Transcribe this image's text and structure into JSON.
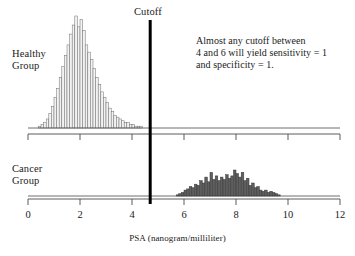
{
  "figure": {
    "title": "",
    "cutoff_label": "Cutoff",
    "annotation_lines": [
      "Almost any cutoff between",
      "4 and 6 will yield sensitivity = 1",
      "and specificity = 1."
    ],
    "healthy_group_label_lines": [
      "Healthy",
      "Group"
    ],
    "cancer_group_label_lines": [
      "Cancer",
      "Group"
    ],
    "axis_title": "PSA  (nanogram/milliliter)"
  },
  "colors": {
    "axis": "#4a4a4a",
    "cutoff": "#000000",
    "healthy_bar_fill": "#f2f2f2",
    "healthy_bar_stroke": "#6e6e6e",
    "cancer_bar_fill": "#5e5e5e",
    "cancer_bar_stroke": "#3a3a3a",
    "text": "#1a1a1a"
  },
  "chart_data": {
    "type": "bar",
    "title": "",
    "subtitle": "",
    "xlabel": "PSA  (nanogram/milliliter)",
    "ylabel": "",
    "xlim": [
      0,
      12
    ],
    "grid": false,
    "legend": "none",
    "tick_labels": [
      "0",
      "2",
      "4",
      "6",
      "8",
      "10",
      "12"
    ],
    "tick_values": [
      0,
      2,
      4,
      6,
      8,
      10,
      12
    ],
    "annotations": [
      {
        "name": "cutoff-line",
        "x": 4.7,
        "label": "Cutoff"
      },
      {
        "name": "note",
        "text": "Almost any cutoff between 4 and 6 will yield sensitivity = 1 and specificity = 1."
      }
    ],
    "bin_width": 0.1,
    "series": [
      {
        "name": "Healthy Group",
        "panel": "top",
        "ymax": 62,
        "x": [
          0.45,
          0.55,
          0.65,
          0.75,
          0.85,
          0.95,
          1.05,
          1.15,
          1.25,
          1.35,
          1.45,
          1.55,
          1.65,
          1.75,
          1.85,
          1.95,
          2.05,
          2.15,
          2.25,
          2.35,
          2.45,
          2.55,
          2.65,
          2.75,
          2.85,
          2.95,
          3.05,
          3.15,
          3.25,
          3.35,
          3.45,
          3.55,
          3.65,
          3.75,
          3.85,
          3.95,
          4.05,
          4.15,
          4.25,
          4.35
        ],
        "values": [
          1,
          2,
          3,
          5,
          8,
          12,
          17,
          22,
          28,
          34,
          40,
          46,
          52,
          57,
          62,
          56,
          60,
          54,
          46,
          42,
          38,
          33,
          28,
          24,
          20,
          17,
          14,
          11,
          9,
          7,
          6,
          5,
          4,
          3,
          3,
          2,
          2,
          1,
          1,
          1
        ]
      },
      {
        "name": "Cancer Group",
        "panel": "bottom",
        "ymax": 22,
        "x": [
          5.75,
          5.85,
          5.95,
          6.05,
          6.15,
          6.25,
          6.35,
          6.45,
          6.55,
          6.65,
          6.75,
          6.85,
          6.95,
          7.05,
          7.15,
          7.25,
          7.35,
          7.45,
          7.55,
          7.65,
          7.75,
          7.85,
          7.95,
          8.05,
          8.15,
          8.25,
          8.35,
          8.45,
          8.55,
          8.65,
          8.75,
          8.85,
          8.95,
          9.05,
          9.15,
          9.25,
          9.35,
          9.45,
          9.55,
          9.65
        ],
        "values": [
          1,
          2,
          3,
          5,
          6,
          8,
          7,
          10,
          9,
          13,
          11,
          16,
          12,
          20,
          14,
          17,
          13,
          16,
          14,
          18,
          15,
          17,
          22,
          19,
          16,
          20,
          13,
          15,
          9,
          11,
          7,
          8,
          5,
          4,
          5,
          3,
          4,
          3,
          2,
          1
        ]
      }
    ]
  }
}
